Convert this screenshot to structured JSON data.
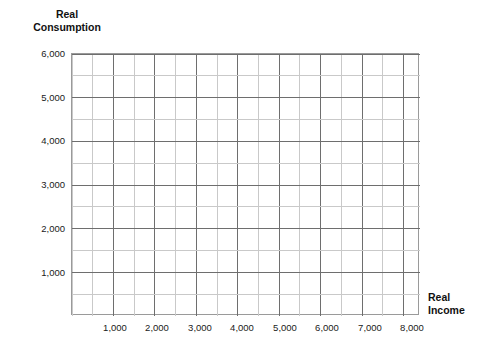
{
  "chart_data": {
    "type": "line",
    "title": "",
    "subtitle": "",
    "xlabel": "Real Income",
    "ylabel": "Real Consumption",
    "xlim": [
      0,
      8400
    ],
    "ylim": [
      0,
      6000
    ],
    "x_major_ticks": [
      1000,
      2000,
      3000,
      4000,
      5000,
      6000,
      7000,
      8000
    ],
    "x_tick_labels": [
      "1,000",
      "2,000",
      "3,000",
      "4,000",
      "5,000",
      "6,000",
      "7,000",
      "8,000"
    ],
    "y_major_ticks": [
      1000,
      2000,
      3000,
      4000,
      5000,
      6000
    ],
    "y_tick_labels": [
      "1,000",
      "2,000",
      "3,000",
      "4,000",
      "5,000",
      "6,000"
    ],
    "x_minor_step": 500,
    "y_minor_step": 500,
    "grid": true,
    "grid_major_color": "#6e6e6e",
    "grid_minor_color": "#c9c9c9",
    "frame_color": "#9a9a9a",
    "background_color": "#ffffff",
    "legend": [],
    "annotations": [],
    "series": [],
    "note": "Empty grid worksheet — no plotted data series"
  },
  "axes": {
    "y_axis_title": "Real\nConsumption",
    "x_axis_title": "Real\nIncome"
  },
  "ticks": {
    "y": [
      {
        "value": 6000,
        "label": "6,000"
      },
      {
        "value": 5000,
        "label": "5,000"
      },
      {
        "value": 4000,
        "label": "4,000"
      },
      {
        "value": 3000,
        "label": "3,000"
      },
      {
        "value": 2000,
        "label": "2,000"
      },
      {
        "value": 1000,
        "label": "1,000"
      }
    ],
    "x": [
      {
        "value": 1000,
        "label": "1,000"
      },
      {
        "value": 2000,
        "label": "2,000"
      },
      {
        "value": 3000,
        "label": "3,000"
      },
      {
        "value": 4000,
        "label": "4,000"
      },
      {
        "value": 5000,
        "label": "5,000"
      },
      {
        "value": 6000,
        "label": "6,000"
      },
      {
        "value": 7000,
        "label": "7,000"
      },
      {
        "value": 8000,
        "label": "8,000"
      }
    ]
  }
}
